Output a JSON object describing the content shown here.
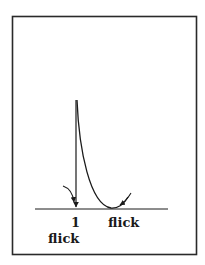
{
  "diagram": {
    "caption_fragment": "",
    "labels": {
      "count": "1",
      "under_count": "flick",
      "right": "flick"
    },
    "colors": {
      "stroke": "#1a1a1a",
      "frame": "#2a2a2a",
      "background": "#ffffff"
    }
  }
}
